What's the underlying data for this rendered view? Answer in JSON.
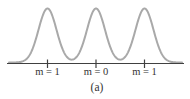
{
  "figure": {
    "caption": "(a)",
    "caption_x": 97,
    "labels": [
      {
        "text": "m = 1",
        "x": 47.5
      },
      {
        "text": "m = 0",
        "x": 96
      },
      {
        "text": "m = 1",
        "x": 144.5
      }
    ],
    "colors": {
      "curve": "#a9a9a9",
      "axis": "#404040",
      "text": "#333333",
      "background": "#ffffff"
    }
  },
  "chart_data": {
    "type": "line",
    "title": "",
    "xlabel": "",
    "ylabel": "",
    "categories": [
      "m = 1",
      "m = 0",
      "m = 1"
    ],
    "values": [
      1,
      1,
      1
    ],
    "peak_x_px": [
      47.5,
      96,
      144.5
    ],
    "peak_top_y_px": 9.5,
    "axis_y_px": 63.5,
    "axis_x_start_px": 7,
    "axis_x_end_px": 184,
    "tick_top_y_px": 59.5,
    "tick_bottom_y_px": 68,
    "gaussian_sigma_px": 9,
    "curve_x_start_px": 9,
    "curve_x_end_px": 182,
    "grid": false,
    "legend": false
  }
}
